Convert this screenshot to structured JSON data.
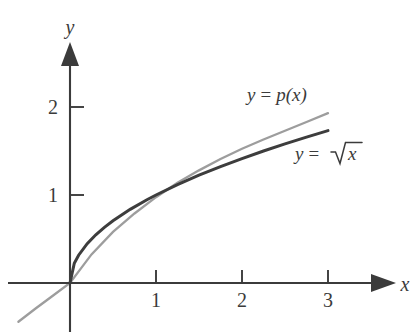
{
  "figure": {
    "kind": "math-plot",
    "background": "#ffffff",
    "axis_color": "#3b3b3b",
    "axes": {
      "x": {
        "label": "x",
        "ticks": [
          "1",
          "2",
          "3"
        ],
        "tick_values": [
          1,
          2,
          3
        ],
        "range": [
          -0.65,
          3.6
        ],
        "arrow": true
      },
      "y": {
        "label": "y",
        "ticks": [
          "1",
          "2"
        ],
        "tick_values": [
          1,
          2
        ],
        "range": [
          -0.55,
          2.95
        ],
        "arrow": true
      }
    },
    "labels": {
      "p_curve": {
        "lhs": "y",
        "eq": "=",
        "rhs": "p(x)",
        "color": "#3b3b3b"
      },
      "sqrt_curve": {
        "lhs": "y",
        "eq": "=",
        "radicand": "x",
        "color": "#3b3b3b"
      }
    }
  },
  "chart_data": {
    "type": "line",
    "title": "",
    "xlabel": "x",
    "ylabel": "y",
    "xlim": [
      -0.65,
      3.6
    ],
    "ylim": [
      -0.55,
      2.95
    ],
    "xticks": [
      1,
      2,
      3
    ],
    "yticks": [
      1,
      2
    ],
    "grid": false,
    "legend": "inline-annotations",
    "series": [
      {
        "name": "y = sqrt(x)",
        "color": "#3d3d3d",
        "linewidth": 3.0,
        "formula": "y = sqrt(x)",
        "x": [
          0,
          0.05,
          0.1,
          0.2,
          0.3,
          0.4,
          0.5,
          0.7,
          0.9,
          1.0,
          1.25,
          1.5,
          1.75,
          2.0,
          2.25,
          2.5,
          2.75,
          3.0
        ],
        "y": [
          0,
          0.224,
          0.316,
          0.447,
          0.548,
          0.632,
          0.707,
          0.837,
          0.949,
          1.0,
          1.118,
          1.225,
          1.323,
          1.414,
          1.5,
          1.581,
          1.658,
          1.732
        ]
      },
      {
        "name": "y = p(x)",
        "color": "#9d9d9d",
        "linewidth": 2.3,
        "formula": "y = p(x), quadratic approximation to sqrt(x)",
        "x": [
          -0.6,
          -0.4,
          -0.2,
          0,
          0.25,
          0.5,
          0.75,
          1.0,
          1.25,
          1.5,
          1.75,
          2.0,
          2.25,
          2.5,
          2.75,
          3.0
        ],
        "y": [
          -0.44,
          -0.29,
          -0.145,
          0.0,
          0.325,
          0.58,
          0.79,
          0.975,
          1.14,
          1.28,
          1.41,
          1.525,
          1.63,
          1.73,
          1.83,
          1.93
        ]
      }
    ],
    "annotations": [
      {
        "text": "y = p(x)",
        "x": 2.25,
        "y": 2.15,
        "name": "p-curve-label"
      },
      {
        "text": "y = √x",
        "x": 3.0,
        "y": 1.52,
        "name": "sqrt-curve-label"
      }
    ]
  }
}
